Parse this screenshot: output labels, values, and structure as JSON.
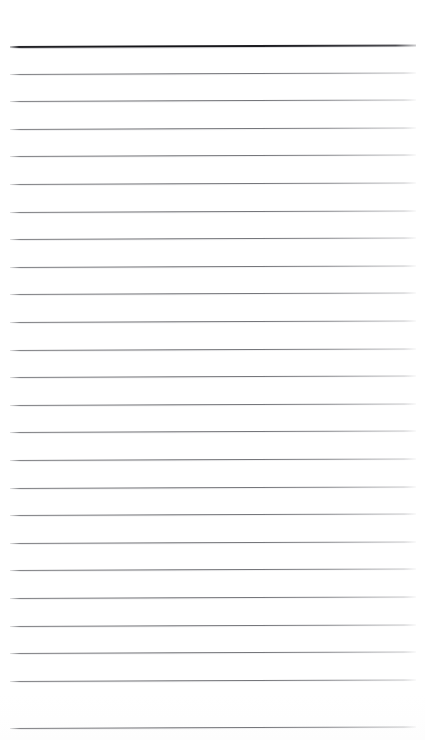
{
  "page": {
    "kind": "ruled-notepad-page",
    "width": 425,
    "height": 740,
    "background_color": "#ffffff",
    "paper_tone": "#ffffff",
    "skew_degrees": -0.22,
    "content_text": "",
    "note": "Scanned blank lined writing paper; no text, headings, figures or captions are present."
  },
  "ruling": {
    "line_count": 25,
    "line_spacing_px": 27.6,
    "first_line_y": 46,
    "left_margin_x": 10,
    "right_margin_x": 416,
    "line_length_px": 406,
    "header_rule_color": "#1c1c20",
    "header_rule_thickness_px": 2,
    "body_rule_color": "#5c5d62",
    "body_rule_thickness_px": 1,
    "lines": [
      {
        "index": 1,
        "y": 46,
        "weight": "heavy",
        "color": "#1c1c20"
      },
      {
        "index": 2,
        "y": 74,
        "weight": "light",
        "color": "#5c5d62"
      },
      {
        "index": 3,
        "y": 101,
        "weight": "light",
        "color": "#5c5d62"
      },
      {
        "index": 4,
        "y": 129,
        "weight": "light",
        "color": "#5c5d62"
      },
      {
        "index": 5,
        "y": 156,
        "weight": "light",
        "color": "#5c5d62"
      },
      {
        "index": 6,
        "y": 184,
        "weight": "light",
        "color": "#5c5d62"
      },
      {
        "index": 7,
        "y": 212,
        "weight": "light",
        "color": "#5c5d62"
      },
      {
        "index": 8,
        "y": 239,
        "weight": "light",
        "color": "#5c5d62"
      },
      {
        "index": 9,
        "y": 267,
        "weight": "light",
        "color": "#5c5d62"
      },
      {
        "index": 10,
        "y": 294,
        "weight": "light",
        "color": "#5c5d62"
      },
      {
        "index": 11,
        "y": 322,
        "weight": "light",
        "color": "#5c5d62"
      },
      {
        "index": 12,
        "y": 350,
        "weight": "light",
        "color": "#5c5d62"
      },
      {
        "index": 13,
        "y": 377,
        "weight": "light",
        "color": "#5c5d62"
      },
      {
        "index": 14,
        "y": 405,
        "weight": "light",
        "color": "#5c5d62"
      },
      {
        "index": 15,
        "y": 432,
        "weight": "light",
        "color": "#5c5d62"
      },
      {
        "index": 16,
        "y": 460,
        "weight": "light",
        "color": "#5c5d62"
      },
      {
        "index": 17,
        "y": 488,
        "weight": "light",
        "color": "#5c5d62"
      },
      {
        "index": 18,
        "y": 515,
        "weight": "light",
        "color": "#5c5d62"
      },
      {
        "index": 19,
        "y": 543,
        "weight": "light",
        "color": "#5c5d62"
      },
      {
        "index": 20,
        "y": 570,
        "weight": "light",
        "color": "#5c5d62"
      },
      {
        "index": 21,
        "y": 598,
        "weight": "light",
        "color": "#5c5d62"
      },
      {
        "index": 22,
        "y": 626,
        "weight": "light",
        "color": "#5c5d62"
      },
      {
        "index": 23,
        "y": 653,
        "weight": "light",
        "color": "#5c5d62"
      },
      {
        "index": 24,
        "y": 681,
        "weight": "light",
        "color": "#5c5d62"
      },
      {
        "index": 25,
        "y": 728,
        "weight": "light",
        "color": "#5c5d62"
      }
    ]
  }
}
